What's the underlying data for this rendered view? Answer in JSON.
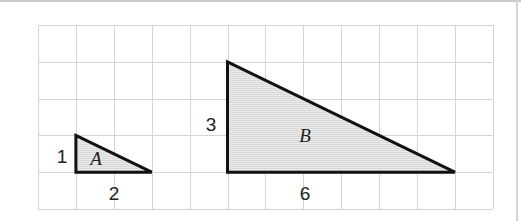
{
  "diagram": {
    "grid": {
      "columns": 12,
      "rows": 5,
      "origin_x": 38,
      "origin_y": 25,
      "cell_w": 37.9,
      "cell_h": 36.8,
      "line_color": "#d4d4d4"
    },
    "fill_color": "#e6e6e6",
    "stroke_color": "#111111",
    "triangles": [
      {
        "name": "A",
        "label": "A",
        "height_label": "1",
        "base_label": "2",
        "height": 1,
        "base": 2,
        "vertices_grid": [
          [
            1,
            3
          ],
          [
            1,
            4
          ],
          [
            3,
            4
          ]
        ]
      },
      {
        "name": "B",
        "label": "B",
        "height_label": "3",
        "base_label": "6",
        "height": 3,
        "base": 6,
        "vertices_grid": [
          [
            5,
            1
          ],
          [
            5,
            4
          ],
          [
            11,
            4
          ]
        ]
      }
    ]
  }
}
